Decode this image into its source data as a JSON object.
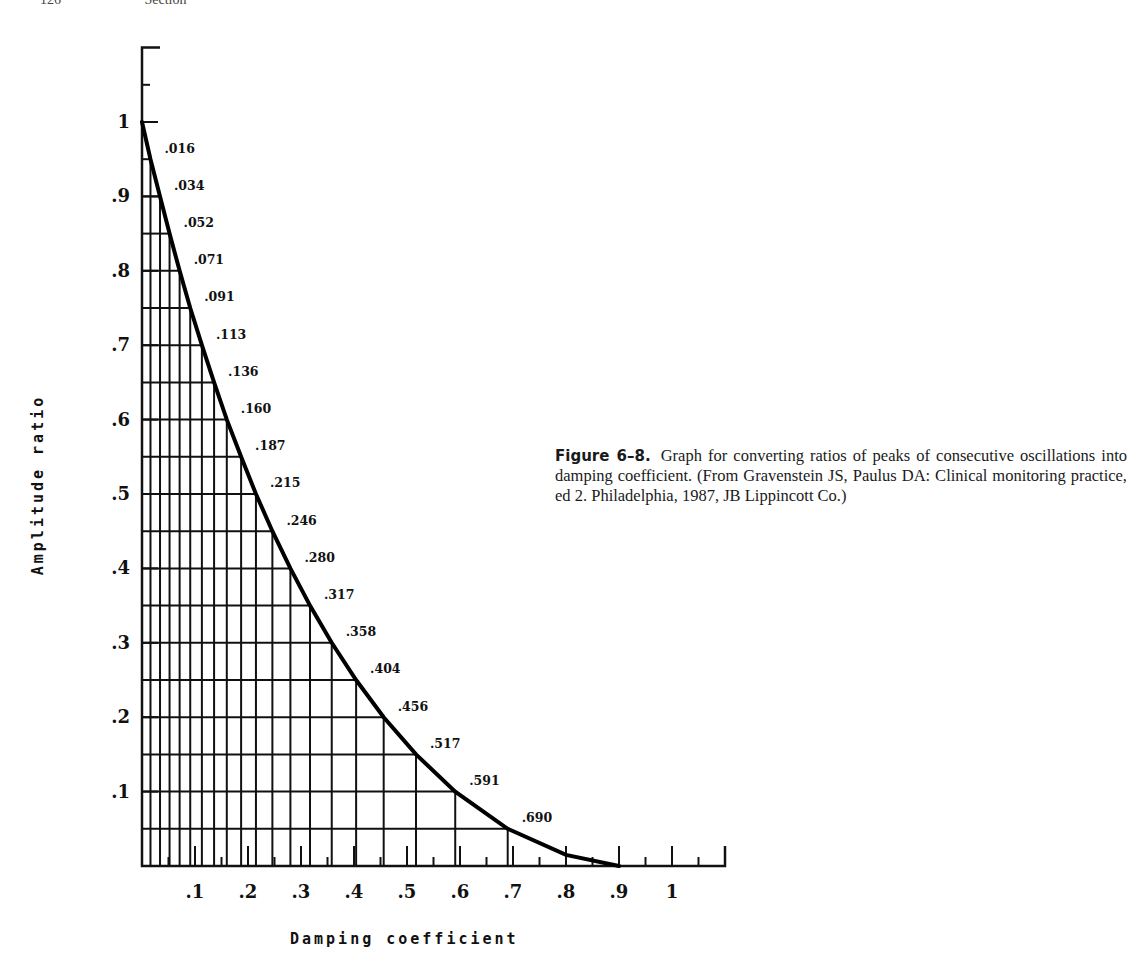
{
  "page": {
    "running_head": [
      "126",
      "Section"
    ]
  },
  "figure": {
    "label": "Figure 6–8.",
    "caption": "Graph for converting ratios of peaks of consecutive oscillations into damping coefficient. (From Gravenstein JS, Paulus DA: Clinical monitoring practice, ed 2. Philadelphia, 1987, JB Lippincott Co.)"
  },
  "chart_data": {
    "type": "line",
    "title": "",
    "xlabel": "Damping coefficient",
    "ylabel": "Amplitude ratio",
    "xlim": [
      0,
      1.1
    ],
    "ylim": [
      0,
      1.1
    ],
    "x_ticks": [
      ".1",
      ".2",
      ".3",
      ".4",
      ".5",
      ".6",
      ".7",
      ".8",
      ".9",
      "1"
    ],
    "y_ticks": [
      ".1",
      ".2",
      ".3",
      ".4",
      ".5",
      ".6",
      ".7",
      ".8",
      ".9",
      "1"
    ],
    "grid": true,
    "series": [
      {
        "name": "Damping coefficient vs amplitude ratio",
        "x": [
          0,
          0.016,
          0.034,
          0.052,
          0.071,
          0.091,
          0.113,
          0.136,
          0.16,
          0.187,
          0.215,
          0.246,
          0.28,
          0.317,
          0.358,
          0.404,
          0.456,
          0.517,
          0.591,
          0.69,
          0.8,
          0.9
        ],
        "y": [
          1.0,
          0.95,
          0.9,
          0.85,
          0.8,
          0.75,
          0.7,
          0.65,
          0.6,
          0.55,
          0.5,
          0.45,
          0.4,
          0.35,
          0.3,
          0.25,
          0.2,
          0.15,
          0.1,
          0.05,
          0.015,
          0.0
        ]
      }
    ],
    "point_labels": [
      ".016",
      ".034",
      ".052",
      ".071",
      ".091",
      ".113",
      ".136",
      ".160",
      ".187",
      ".215",
      ".246",
      ".280",
      ".317",
      ".358",
      ".404",
      ".456",
      ".517",
      ".591",
      ".690"
    ]
  }
}
